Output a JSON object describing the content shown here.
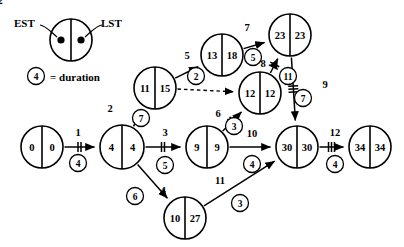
{
  "diagram": {
    "type": "activity-on-arrow-network",
    "title_present": false,
    "colors": {
      "stroke": "#000000",
      "background": "#ffffff"
    },
    "legend": {
      "est_label": "EST",
      "lst_label": "LST",
      "duration_value": "4",
      "duration_text": "= duration"
    },
    "nodes": [
      {
        "id": "n1",
        "est": "0",
        "lst": "0",
        "cx": 42,
        "cy": 147,
        "r": 21
      },
      {
        "id": "n2",
        "est": "4",
        "lst": "4",
        "cx": 122,
        "cy": 147,
        "r": 22
      },
      {
        "id": "n3",
        "est": "11",
        "lst": "15",
        "cx": 155,
        "cy": 88,
        "r": 21
      },
      {
        "id": "n4",
        "est": "13",
        "lst": "18",
        "cx": 222,
        "cy": 55,
        "r": 21
      },
      {
        "id": "n5",
        "est": "9",
        "lst": "9",
        "cx": 207,
        "cy": 147,
        "r": 21
      },
      {
        "id": "n6",
        "est": "12",
        "lst": "12",
        "cx": 260,
        "cy": 93,
        "r": 21
      },
      {
        "id": "n7",
        "est": "23",
        "lst": "23",
        "cx": 290,
        "cy": 35,
        "r": 21
      },
      {
        "id": "n8",
        "est": "10",
        "lst": "27",
        "cx": 185,
        "cy": 218,
        "r": 21
      },
      {
        "id": "n9",
        "est": "30",
        "lst": "30",
        "cx": 297,
        "cy": 147,
        "r": 21
      },
      {
        "id": "n10",
        "est": "34",
        "lst": "34",
        "cx": 370,
        "cy": 147,
        "r": 21
      }
    ],
    "edges": [
      {
        "id": "e1",
        "activity": "1",
        "duration": "4",
        "from": "n1",
        "to": "n2",
        "style": "solid",
        "ticks": 2,
        "label_x": 78,
        "label_y": 132,
        "dur_x": 78,
        "dur_y": 163
      },
      {
        "id": "e2",
        "activity": "2",
        "duration": "7",
        "from": "n2",
        "to": "n3",
        "style": "solid",
        "ticks": 0,
        "label_x": 110,
        "label_y": 108,
        "dur_x": 141,
        "dur_y": 118
      },
      {
        "id": "e3",
        "activity": "3",
        "duration": "5",
        "from": "n2",
        "to": "n5",
        "style": "solid",
        "ticks": 2,
        "label_x": 165,
        "label_y": 132,
        "dur_x": 165,
        "dur_y": 165
      },
      {
        "id": "e4",
        "activity": "4",
        "duration": "6",
        "from": "n2",
        "to": "n8",
        "style": "solid",
        "ticks": 0,
        "label_x": 163,
        "label_y": 190,
        "dur_x": 135,
        "dur_y": 196
      },
      {
        "id": "e5",
        "activity": "5",
        "duration": "2",
        "from": "n3",
        "to": "n4",
        "style": "solid",
        "ticks": 0,
        "label_x": 187,
        "label_y": 55,
        "dur_x": 196,
        "dur_y": 76
      },
      {
        "id": "e6",
        "activity": "2",
        "duration": "",
        "from": "n3",
        "to": "n6",
        "style": "dashed",
        "ticks": 0,
        "label_x": 0,
        "label_y": 0,
        "dur_x": 0,
        "dur_y": 0
      },
      {
        "id": "e7",
        "activity": "7",
        "duration": "5",
        "from": "n4",
        "to": "n7",
        "style": "solid",
        "ticks": 0,
        "label_x": 247,
        "label_y": 27,
        "dur_x": 253,
        "dur_y": 57
      },
      {
        "id": "e8",
        "activity": "8",
        "duration": "11",
        "from": "n6",
        "to": "n7",
        "style": "solid",
        "ticks": 2,
        "label_x": 263,
        "label_y": 63,
        "dur_x": 288,
        "dur_y": 76
      },
      {
        "id": "e9",
        "activity": "6",
        "duration": "3",
        "from": "n5",
        "to": "n6",
        "style": "solid",
        "ticks": 2,
        "label_x": 218,
        "label_y": 113,
        "dur_x": 234,
        "dur_y": 126
      },
      {
        "id": "e10",
        "activity": "9",
        "duration": "7",
        "from": "n7",
        "to": "n9",
        "style": "solid",
        "ticks": 3,
        "label_x": 325,
        "label_y": 84,
        "dur_x": 303,
        "dur_y": 98
      },
      {
        "id": "e11",
        "activity": "10",
        "duration": "4",
        "from": "n5",
        "to": "n9",
        "style": "solid",
        "ticks": 0,
        "label_x": 252,
        "label_y": 133,
        "dur_x": 252,
        "dur_y": 164
      },
      {
        "id": "e12",
        "activity": "11",
        "duration": "3",
        "from": "n8",
        "to": "n9",
        "style": "solid",
        "ticks": 0,
        "label_x": 220,
        "label_y": 180,
        "dur_x": 240,
        "dur_y": 203
      },
      {
        "id": "e13",
        "activity": "12",
        "duration": "4",
        "from": "n9",
        "to": "n10",
        "style": "solid",
        "ticks": 3,
        "label_x": 335,
        "label_y": 132,
        "dur_x": 335,
        "dur_y": 164
      }
    ]
  }
}
